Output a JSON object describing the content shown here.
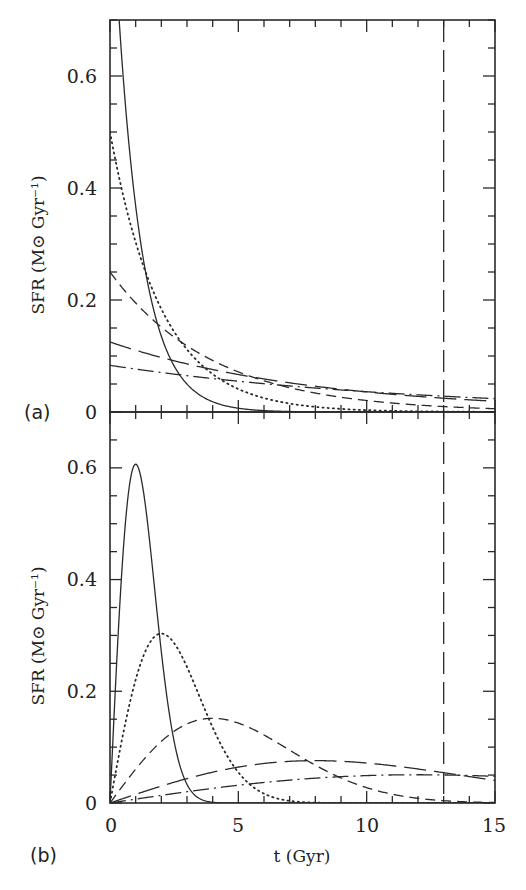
{
  "chart_data": [
    {
      "type": "line",
      "panel": "(a)",
      "title": "",
      "xlabel": "",
      "ylabel": "SFR (M⊙ Gyr⁻¹)",
      "xlim": [
        0,
        15
      ],
      "ylim": [
        0,
        0.7
      ],
      "xticks": [
        0,
        5,
        10,
        15
      ],
      "yticks": [
        0,
        0.2,
        0.4,
        0.6
      ],
      "ytick_labels": [
        "0",
        "0.2",
        "0.4",
        "0.6"
      ],
      "grid": false,
      "legend": "none",
      "model": "exponential: SFR(t) = exp(-t/tau)/tau",
      "x": [
        0,
        1,
        2,
        3,
        4,
        5,
        6,
        7,
        8,
        9,
        10,
        11,
        12,
        13,
        14,
        15
      ],
      "series": [
        {
          "name": "tau=1 Gyr",
          "style": "solid",
          "tau": 1,
          "values": [
            1.0,
            0.368,
            0.135,
            0.05,
            0.018,
            0.007,
            0.002,
            0.001,
            0,
            0,
            0,
            0,
            0,
            0,
            0,
            0
          ]
        },
        {
          "name": "tau=2 Gyr",
          "style": "dotted",
          "tau": 2,
          "values": [
            0.5,
            0.303,
            0.184,
            0.112,
            0.068,
            0.041,
            0.025,
            0.015,
            0.009,
            0.006,
            0.003,
            0.002,
            0.001,
            0.001,
            0.0,
            0.0
          ]
        },
        {
          "name": "tau=4 Gyr",
          "style": "short-dashed",
          "tau": 4,
          "values": [
            0.25,
            0.195,
            0.152,
            0.118,
            0.092,
            0.072,
            0.056,
            0.043,
            0.034,
            0.026,
            0.021,
            0.016,
            0.012,
            0.01,
            0.008,
            0.006
          ]
        },
        {
          "name": "tau=8 Gyr",
          "style": "long-dashed",
          "tau": 8,
          "values": [
            0.125,
            0.11,
            0.097,
            0.086,
            0.076,
            0.067,
            0.059,
            0.052,
            0.046,
            0.041,
            0.036,
            0.032,
            0.028,
            0.024,
            0.022,
            0.019
          ]
        },
        {
          "name": "tau=12 Gyr",
          "style": "dash-dot",
          "tau": 12,
          "values": [
            0.083,
            0.077,
            0.071,
            0.065,
            0.06,
            0.055,
            0.051,
            0.046,
            0.043,
            0.039,
            0.036,
            0.033,
            0.031,
            0.028,
            0.026,
            0.024
          ]
        }
      ],
      "annotations": [
        {
          "type": "vertical-line",
          "x": 13,
          "style": "long-dashed"
        }
      ]
    },
    {
      "type": "line",
      "panel": "(b)",
      "title": "",
      "xlabel": "t (Gyr)",
      "ylabel": "SFR (M⊙ Gyr⁻¹)",
      "xlim": [
        0,
        15
      ],
      "ylim": [
        0,
        0.7
      ],
      "xticks": [
        0,
        5,
        10,
        15
      ],
      "xtick_labels": [
        "0",
        "5",
        "10",
        "15"
      ],
      "yticks": [
        0,
        0.2,
        0.4,
        0.6
      ],
      "ytick_labels": [
        "0",
        "0.2",
        "0.4",
        "0.6"
      ],
      "grid": false,
      "legend": "none",
      "model": "delayed Gaussian-like: SFR(t) = (t/tau^2) exp(-t^2/(2 tau^2))",
      "x": [
        0,
        1,
        2,
        3,
        4,
        5,
        6,
        7,
        8,
        9,
        10,
        11,
        12,
        13,
        14,
        15
      ],
      "series": [
        {
          "name": "tau=1 Gyr",
          "style": "solid",
          "tau": 1,
          "peak": {
            "x": 1,
            "y": 0.61
          },
          "values": [
            0,
            0.607,
            0.271,
            0.033,
            0.001,
            0,
            0,
            0,
            0,
            0,
            0,
            0,
            0,
            0,
            0,
            0
          ]
        },
        {
          "name": "tau=2 Gyr",
          "style": "dotted",
          "tau": 2,
          "peak": {
            "x": 2,
            "y": 0.3
          },
          "values": [
            0,
            0.221,
            0.303,
            0.244,
            0.135,
            0.055,
            0.017,
            0.004,
            0.001,
            0,
            0,
            0,
            0,
            0,
            0,
            0
          ]
        },
        {
          "name": "tau=4 Gyr",
          "style": "short-dashed",
          "tau": 4,
          "peak": {
            "x": 4,
            "y": 0.15
          },
          "values": [
            0,
            0.061,
            0.11,
            0.142,
            0.152,
            0.143,
            0.122,
            0.095,
            0.068,
            0.045,
            0.027,
            0.016,
            0.008,
            0.004,
            0.002,
            0.001
          ]
        },
        {
          "name": "tau=8 Gyr",
          "style": "long-dashed",
          "tau": 8,
          "peak": {
            "x": 8,
            "y": 0.076
          },
          "values": [
            0,
            0.016,
            0.03,
            0.044,
            0.055,
            0.064,
            0.071,
            0.074,
            0.076,
            0.074,
            0.071,
            0.067,
            0.061,
            0.054,
            0.047,
            0.041
          ]
        },
        {
          "name": "tau=12 Gyr",
          "style": "dash-dot",
          "tau": 12,
          "peak": {
            "x": 12,
            "y": 0.051
          },
          "values": [
            0,
            0.007,
            0.014,
            0.02,
            0.026,
            0.032,
            0.037,
            0.041,
            0.045,
            0.048,
            0.05,
            0.051,
            0.051,
            0.05,
            0.049,
            0.047
          ]
        }
      ],
      "annotations": [
        {
          "type": "vertical-line",
          "x": 13,
          "style": "long-dashed"
        }
      ]
    }
  ],
  "figure": {
    "panel_a_label": "(a)",
    "panel_b_label": "(b)",
    "x_axis_title": "t (Gyr)",
    "y_axis_title_a": "SFR (M⊙ Gyr⁻¹)",
    "y_axis_title_b": "SFR (M⊙ Gyr⁻¹)",
    "ytick_labels": [
      "0",
      "0.2",
      "0.4",
      "0.6"
    ],
    "xtick_labels": [
      "0",
      "5",
      "10",
      "15"
    ],
    "line_color": "#2a2a2a",
    "vertical_line_x": 13
  }
}
